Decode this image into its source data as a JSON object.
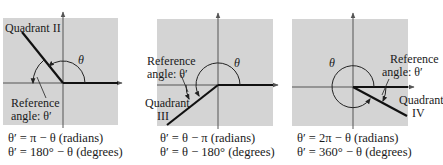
{
  "panels": [
    {
      "id": "quadrant-ii",
      "quadrant_label": "Quadrant II",
      "theta_label": "θ",
      "ref_label_line1": "Reference",
      "ref_label_line2": "angle:  θ′",
      "formula_radians": "θ′ = π − θ (radians)",
      "formula_degrees": "θ′ = 180° − θ (degrees)"
    },
    {
      "id": "quadrant-iii",
      "quadrant_label_line1": "Quadrant",
      "quadrant_label_line2": "III",
      "theta_label": "θ",
      "ref_label_line1": "Reference",
      "ref_label_line2": "angle:  θ′",
      "formula_radians": "θ′ = θ − π (radians)",
      "formula_degrees": "θ′ = θ − 180° (degrees)"
    },
    {
      "id": "quadrant-iv",
      "quadrant_label_line1": "Quadrant",
      "quadrant_label_line2": "IV",
      "theta_label": "θ",
      "ref_label_line1": "Reference",
      "ref_label_line2": "angle:  θ′",
      "formula_radians": "θ′ = 2π − θ (radians)",
      "formula_degrees": "θ′ = 360° − θ (degrees)"
    }
  ],
  "colors": {
    "panel_fill": "#d4d4d4",
    "axis": "#555555",
    "ray": "#111111"
  }
}
